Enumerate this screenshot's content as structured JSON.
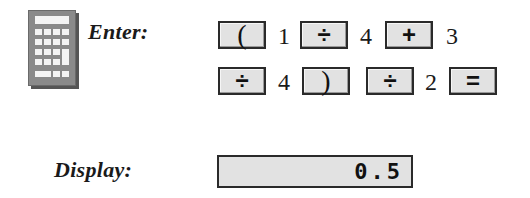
{
  "icon": "calculator-icon",
  "enter_label": "Enter:",
  "display_label": "Display:",
  "keystrokes": {
    "row1": [
      {
        "type": "key",
        "label": "("
      },
      {
        "type": "number",
        "label": "1"
      },
      {
        "type": "key",
        "label": "÷"
      },
      {
        "type": "number",
        "label": "4"
      },
      {
        "type": "key",
        "label": "+"
      },
      {
        "type": "number",
        "label": "3"
      }
    ],
    "row2": [
      {
        "type": "key",
        "label": "÷"
      },
      {
        "type": "number",
        "label": "4"
      },
      {
        "type": "key",
        "label": ")"
      },
      {
        "type": "key",
        "label": "÷"
      },
      {
        "type": "number",
        "label": "2"
      },
      {
        "type": "key",
        "label": "="
      }
    ]
  },
  "display_value": "0.5",
  "colors": {
    "key_fill": "#e2e2e2",
    "key_border": "#2a2a2a",
    "icon_body": "#8a8a8a"
  }
}
